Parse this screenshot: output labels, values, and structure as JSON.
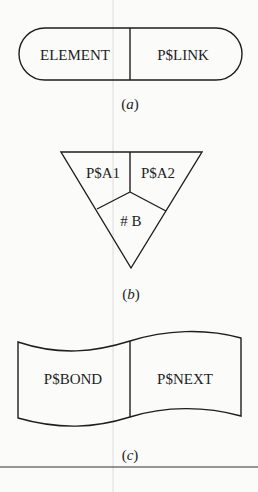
{
  "figure": {
    "panels": [
      {
        "id": "a",
        "shape": "rounded-pill",
        "fields": [
          "ELEMENT",
          "P$LINK"
        ],
        "caption": "a"
      },
      {
        "id": "b",
        "shape": "inverted-triangle",
        "fields": [
          "P$A1",
          "P$A2",
          "# B"
        ],
        "caption": "b"
      },
      {
        "id": "c",
        "shape": "wavy-banner",
        "fields": [
          "P$BOND",
          "P$NEXT"
        ],
        "caption": "c"
      }
    ],
    "colors": {
      "ink": "#1e1e1e",
      "paper": "#fbfbfa",
      "guide": "#cfcfcf"
    }
  }
}
